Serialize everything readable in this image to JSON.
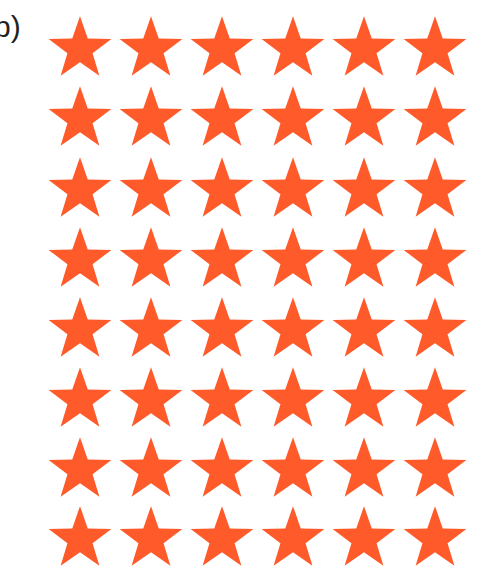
{
  "label": "b)",
  "grid": {
    "rows": 8,
    "cols": 6,
    "star_color": "#FF5A2A",
    "col_centers": [
      80,
      151,
      222,
      293,
      364,
      435
    ],
    "row_tops": [
      14,
      84,
      155,
      225,
      295,
      365,
      435,
      504
    ]
  }
}
